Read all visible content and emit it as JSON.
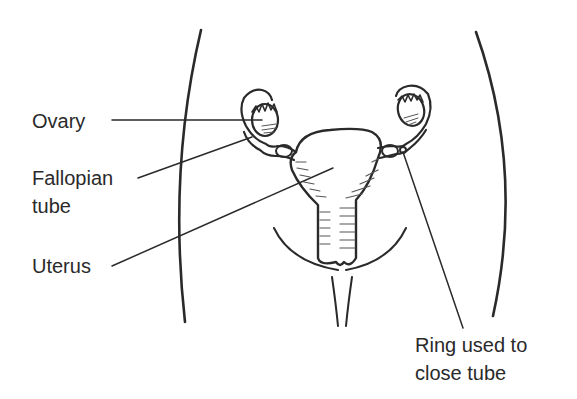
{
  "diagram": {
    "labels": {
      "ovary": "Ovary",
      "fallopian_line1": "Fallopian",
      "fallopian_line2": "tube",
      "uterus": "Uterus",
      "ring_line1": "Ring used to",
      "ring_line2": "close tube"
    },
    "colors": {
      "line": "#2a2a2a",
      "background": "#ffffff"
    }
  }
}
